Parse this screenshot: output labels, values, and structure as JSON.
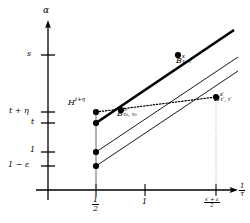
{
  "figure": {
    "title": "",
    "background_color": "#ffffff",
    "ink_color": "#000000",
    "width": 250,
    "height": 223
  },
  "axes": {
    "y_axis_label": "α",
    "x_axis_label_num": "1",
    "x_axis_label_den": "τ",
    "y_ticks": [
      {
        "label": "s",
        "value_y": 55
      },
      {
        "label": "t + η",
        "value_y": 112
      },
      {
        "label": "t",
        "value_y": 123
      },
      {
        "label": "1",
        "value_y": 152
      },
      {
        "label": "1 − ε",
        "value_y": 166
      }
    ],
    "x_ticks": [
      {
        "label_num": "1",
        "label_den": "2",
        "value_x": 96
      },
      {
        "label": "1",
        "value_x": 145
      },
      {
        "label_num": "s′ + ε",
        "label_den": "2",
        "value_x": 216
      }
    ],
    "origin": {
      "x": 48,
      "y": 190
    },
    "x_axis_end": 238,
    "y_axis_top": 22
  },
  "points": [
    {
      "name": "H-t-plus-eta",
      "x": 96,
      "y": 112
    },
    {
      "name": "B-t",
      "x": 96,
      "y": 123
    },
    {
      "name": "B-one",
      "x": 96,
      "y": 152
    },
    {
      "name": "B-one-minus-eps",
      "x": 96,
      "y": 166
    },
    {
      "name": "B-t0-tau0",
      "x": 121,
      "y": 110
    },
    {
      "name": "B-s-tau-tau",
      "x": 178,
      "y": 55
    },
    {
      "name": "B-sprime",
      "x": 216,
      "y": 97
    }
  ],
  "labels": {
    "H_main": "H",
    "H_sup": "t+η",
    "B_s_main": "B",
    "B_s_sup": "s",
    "B_s_sub": "τ, τ",
    "B_t0_main": "B",
    "B_t0_sup": "t₀",
    "B_t0_sub": "τ₀, τ₀",
    "B_sp_main": "B",
    "B_sp_sup": "s′",
    "B_sp_sub": "τ′, τ′"
  },
  "curves": [
    {
      "name": "thick-solid-line",
      "style": "solid",
      "width": 2.6,
      "from": {
        "x": 96,
        "y": 123
      },
      "to": {
        "x": 234,
        "y": 30
      }
    },
    {
      "name": "upper-thin-solid-line",
      "style": "solid",
      "width": 0.9,
      "from": {
        "x": 96,
        "y": 152
      },
      "to": {
        "x": 238,
        "y": 57
      }
    },
    {
      "name": "lower-thin-solid-line",
      "style": "solid",
      "width": 0.9,
      "from": {
        "x": 96,
        "y": 166
      },
      "to": {
        "x": 238,
        "y": 71
      }
    },
    {
      "name": "dotted-connector",
      "style": "dotted",
      "width": 1.1,
      "from": {
        "x": 96,
        "y": 112
      },
      "to": {
        "x": 216,
        "y": 97
      }
    },
    {
      "name": "vertical-guide-at-half",
      "style": "solid",
      "width": 0.8,
      "from": {
        "x": 96,
        "y": 112
      },
      "to": {
        "x": 96,
        "y": 190
      }
    },
    {
      "name": "vertical-guide-at-right",
      "style": "dotted-light",
      "width": 0.7,
      "from": {
        "x": 216,
        "y": 97
      },
      "to": {
        "x": 216,
        "y": 190
      }
    }
  ]
}
